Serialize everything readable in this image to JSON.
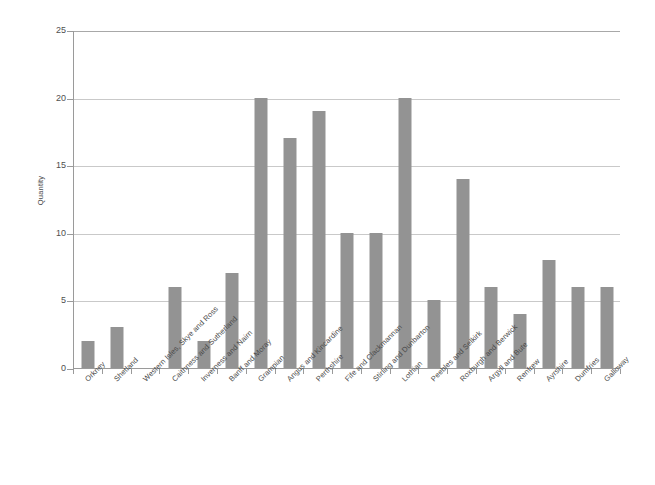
{
  "chart_data": {
    "type": "bar",
    "title": "",
    "xlabel": "",
    "ylabel": "Quantity",
    "ylim": [
      0,
      25
    ],
    "yticks": [
      0,
      5,
      10,
      15,
      20,
      25
    ],
    "grid": true,
    "legend": false,
    "bar_color": "#939393",
    "categories": [
      "Orkney",
      "Shetland",
      "Western Isles, Skye and Ross",
      "Caithness and Sutherland",
      "Inverness and Nairn",
      "Banff and Moray",
      "Grampian",
      "Angus and Kincardine",
      "Perthshire",
      "Fife and Clackmannan",
      "Stirling and Dunbarton",
      "Lothian",
      "Peebles and Selkirk",
      "Roxburgh and Berwick",
      "Argyll and Bute",
      "Renfrew",
      "Ayrshire",
      "Dumfries",
      "Galloway"
    ],
    "values": [
      2,
      3,
      0,
      6,
      2,
      7,
      20,
      17,
      19,
      10,
      10,
      20,
      5,
      14,
      6,
      4,
      8,
      6,
      6
    ]
  }
}
